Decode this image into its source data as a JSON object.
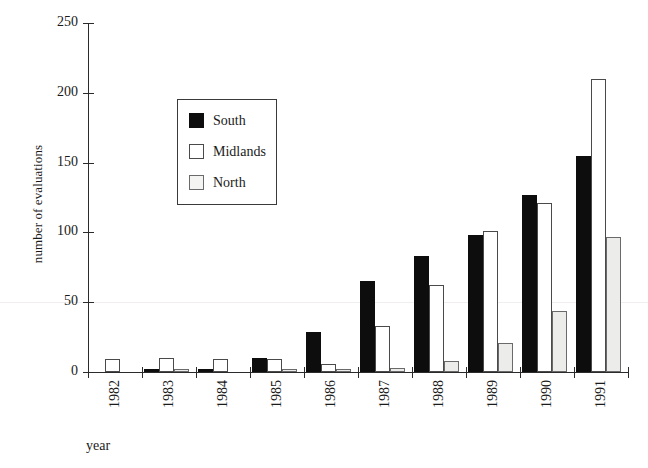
{
  "chart_data": {
    "type": "bar",
    "title": "",
    "xlabel": "year",
    "ylabel": "number of evaluations",
    "categories": [
      "1982",
      "1983",
      "1984",
      "1985",
      "1986",
      "1987",
      "1988",
      "1989",
      "1990",
      "1991"
    ],
    "series": [
      {
        "name": "South",
        "color": "#0d0d0d",
        "values": [
          0,
          2,
          2,
          10,
          29,
          65,
          83,
          98,
          127,
          155
        ]
      },
      {
        "name": "Midlands",
        "color": "#ffffff",
        "values": [
          9,
          10,
          9,
          9,
          6,
          33,
          62,
          101,
          121,
          210
        ]
      },
      {
        "name": "North",
        "color": "#ececeb",
        "values": [
          0,
          2,
          0,
          2,
          2,
          3,
          8,
          21,
          44,
          97
        ]
      }
    ],
    "ylim": [
      0,
      250
    ],
    "yticks": [
      "0",
      "50",
      "100",
      "150",
      "200",
      "250"
    ],
    "ytick_values": [
      0,
      50,
      100,
      150,
      200,
      250
    ],
    "grid": false,
    "legend_position": "upper-left-inside",
    "legend_entries": [
      "South",
      "Midlands",
      "North"
    ]
  },
  "axes": {
    "y_label": "number of evaluations",
    "x_label": "year"
  },
  "legend": {
    "items": [
      {
        "label": "South"
      },
      {
        "label": "Midlands"
      },
      {
        "label": "North"
      }
    ]
  }
}
